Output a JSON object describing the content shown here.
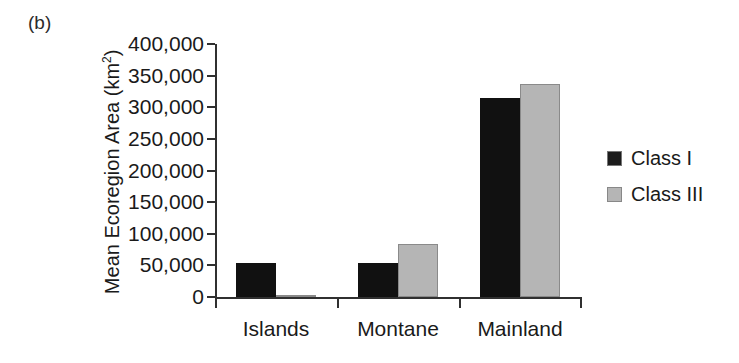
{
  "figure": {
    "panel_label": "(b)"
  },
  "chart_data": {
    "type": "bar",
    "title": "",
    "subtitle": "",
    "xlabel": "",
    "ylabel": "Mean Ecoregion Area (km²)",
    "ylabel_base": "Mean Ecoregion Area (km",
    "ylabel_sup": "2",
    "ylabel_close": ")",
    "categories": [
      "Islands",
      "Montane",
      "Mainland"
    ],
    "series": [
      {
        "name": "Class I",
        "color": "#111111",
        "values": [
          53000,
          53000,
          315000
        ]
      },
      {
        "name": "Class III",
        "color": "#b5b5b5",
        "values": [
          2000,
          84000,
          337000
        ]
      }
    ],
    "ylim": [
      0,
      400000
    ],
    "ytick_values": [
      0,
      50000,
      100000,
      150000,
      200000,
      250000,
      300000,
      350000,
      400000
    ],
    "ytick_labels": [
      "0",
      "50,000",
      "100,000",
      "150,000",
      "200,000",
      "250,000",
      "300,000",
      "350,000",
      "400,000"
    ],
    "grid": false,
    "legend_position": "right",
    "legend_entries": [
      {
        "label": "Class I",
        "color": "#111111"
      },
      {
        "label": "Class III",
        "color": "#b5b5b5"
      }
    ]
  }
}
